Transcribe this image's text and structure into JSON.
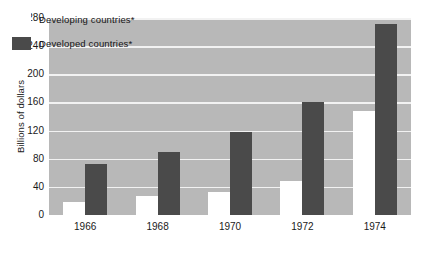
{
  "chart_data": {
    "type": "bar",
    "title": "",
    "subtitle": "",
    "xlabel": "",
    "ylabel": "Billions of dollars",
    "categories": [
      "1966",
      "1968",
      "1970",
      "1972",
      "1974"
    ],
    "series": [
      {
        "name": "Developing countries*",
        "color": "#ffffff",
        "values": [
          18,
          27,
          33,
          48,
          148
        ]
      },
      {
        "name": "Developed countries*",
        "color": "#4a4a4a",
        "values": [
          72,
          90,
          118,
          160,
          272
        ]
      }
    ],
    "ylim": [
      0,
      280
    ],
    "ytick_labels": [
      "0",
      "40",
      "80",
      "120",
      "160",
      "200",
      "240",
      "280"
    ],
    "ytick_values": [
      0,
      40,
      80,
      120,
      160,
      200,
      240,
      280
    ],
    "grid": true,
    "grid_color": "#f2f2f2",
    "plot_background": "#b8b8b8",
    "page_background": "#ffffff",
    "legend_position": "top-left",
    "annotations": []
  },
  "legend": {
    "items": [
      {
        "label": "Developing countries*",
        "swatch": "white-swatch"
      },
      {
        "label": "Developed countries*",
        "swatch": "dark-swatch"
      }
    ]
  }
}
